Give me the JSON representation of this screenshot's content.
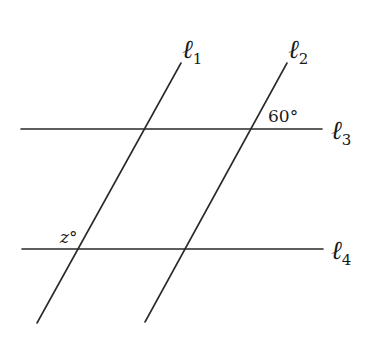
{
  "diagram": {
    "type": "parallel-lines-transversals",
    "lines": [
      {
        "id": "l1",
        "symbol": "ℓ",
        "subscript": "1",
        "kind": "transversal",
        "x1": 37,
        "y1": 323,
        "x2": 181,
        "y2": 63,
        "label_x": 182,
        "label_y": 58
      },
      {
        "id": "l2",
        "symbol": "ℓ",
        "subscript": "2",
        "kind": "transversal",
        "x1": 145,
        "y1": 322,
        "x2": 287,
        "y2": 63,
        "label_x": 288,
        "label_y": 58
      },
      {
        "id": "l3",
        "symbol": "ℓ",
        "subscript": "3",
        "kind": "horizontal",
        "x1": 21,
        "y1": 129,
        "x2": 322,
        "y2": 129,
        "label_x": 331,
        "label_y": 139
      },
      {
        "id": "l4",
        "symbol": "ℓ",
        "subscript": "4",
        "kind": "horizontal",
        "x1": 22,
        "y1": 249,
        "x2": 323,
        "y2": 249,
        "label_x": 331,
        "label_y": 259
      }
    ],
    "angles": [
      {
        "id": "angle-60",
        "text": "60°",
        "x": 268,
        "y": 122
      },
      {
        "id": "angle-z",
        "text": "z°",
        "x": 60,
        "y": 243
      }
    ]
  }
}
